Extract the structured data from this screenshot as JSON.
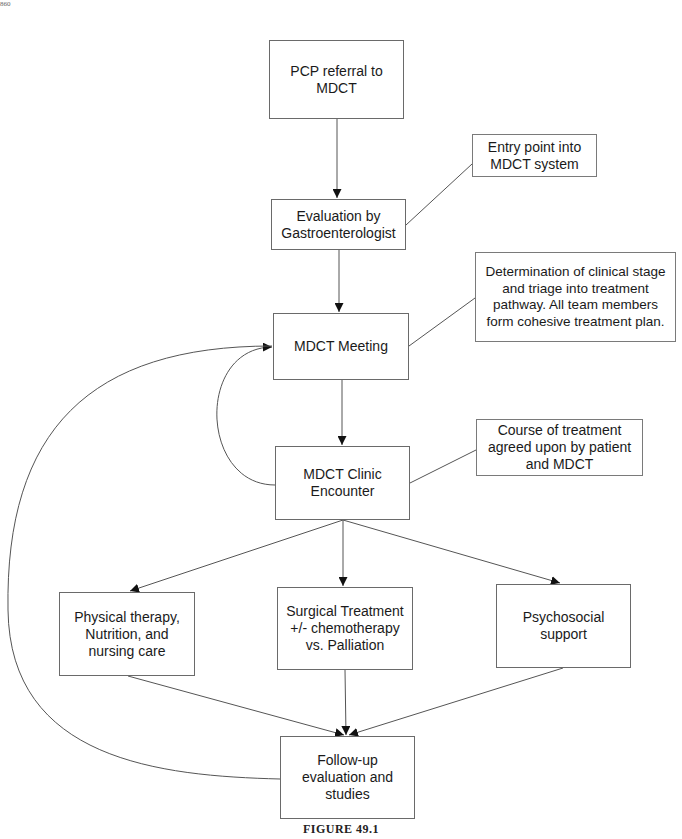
{
  "page_number": "860",
  "nodes": {
    "pcp_referral": "PCP referral to MDCT",
    "evaluation": "Evaluation by Gastroenterologist",
    "mdct_meeting": "MDCT Meeting",
    "clinic_encounter": "MDCT Clinic Encounter",
    "physical_therapy": "Physical therapy, Nutrition, and nursing care",
    "surgical": "Surgical Treatment +/- chemotherapy vs. Palliation",
    "psychosocial": "Psychosocial support",
    "follow_up": "Follow-up evaluation and studies"
  },
  "notes": {
    "entry_point": "Entry point into MDCT system",
    "determination": "Determination of clinical stage and triage into treatment pathway.  All team members form cohesive treatment plan.",
    "course": "Course of treatment agreed upon by patient and MDCT"
  },
  "edges": [
    {
      "from": "pcp_referral",
      "to": "evaluation"
    },
    {
      "from": "evaluation",
      "to": "mdct_meeting"
    },
    {
      "from": "mdct_meeting",
      "to": "clinic_encounter"
    },
    {
      "from": "clinic_encounter",
      "to": "mdct_meeting",
      "style": "curved-loop"
    },
    {
      "from": "clinic_encounter",
      "to": "physical_therapy"
    },
    {
      "from": "clinic_encounter",
      "to": "surgical"
    },
    {
      "from": "clinic_encounter",
      "to": "psychosocial"
    },
    {
      "from": "physical_therapy",
      "to": "follow_up"
    },
    {
      "from": "surgical",
      "to": "follow_up"
    },
    {
      "from": "psychosocial",
      "to": "follow_up"
    },
    {
      "from": "follow_up",
      "to": "mdct_meeting",
      "style": "curved-loop"
    }
  ],
  "caption": "FIGURE 49.1"
}
